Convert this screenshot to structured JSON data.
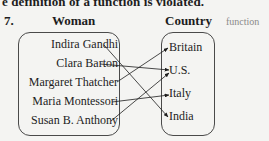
{
  "header_text": "e definition of a function is violated.",
  "problem": {
    "number": "7.",
    "domain_label": "Woman",
    "range_label": "Country",
    "answer_annotation": "function",
    "domain": [
      "Indira Gandhi",
      "Clara Barton",
      "Margaret Thatcher",
      "Maria Montessori",
      "Susan B. Anthony"
    ],
    "range": [
      "Britain",
      "U.S.",
      "Italy",
      "India"
    ],
    "mapping": [
      {
        "from": "Indira Gandhi",
        "to": "India"
      },
      {
        "from": "Clara Barton",
        "to": "U.S."
      },
      {
        "from": "Margaret Thatcher",
        "to": "Britain"
      },
      {
        "from": "Maria Montessori",
        "to": "Italy"
      },
      {
        "from": "Susan B. Anthony",
        "to": "U.S."
      }
    ]
  },
  "colors": {
    "text": "#1d1d1d",
    "annotation": "#8a8a8a",
    "background": "#f4f4f2"
  }
}
